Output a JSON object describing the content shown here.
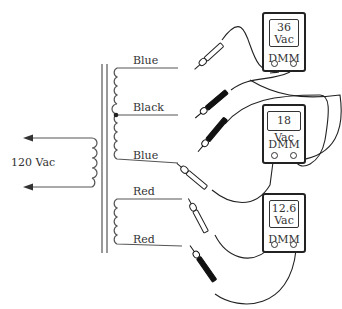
{
  "primary": {
    "label": "120 Vac"
  },
  "secondary_wires": [
    {
      "label": "Blue",
      "position": "top"
    },
    {
      "label": "Black",
      "position": "center-tap"
    },
    {
      "label": "Blue",
      "position": "bottom"
    },
    {
      "label": "Red",
      "position": "top"
    },
    {
      "label": "Red",
      "position": "bottom"
    }
  ],
  "meters": [
    {
      "reading_line1": "36",
      "reading_line2": "Vac",
      "name": "DMM"
    },
    {
      "reading_line1": "18 Vac",
      "reading_line2": "",
      "name": "DMM"
    },
    {
      "reading_line1": "12.6",
      "reading_line2": "Vac",
      "name": "DMM"
    }
  ],
  "colors": {
    "line": "#444444",
    "probe_dark": "#1a1a1a",
    "background": "#ffffff"
  }
}
